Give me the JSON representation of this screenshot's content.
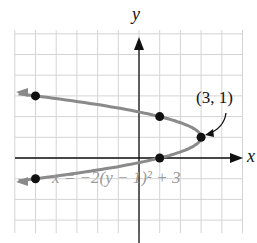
{
  "chart_data": {
    "type": "line",
    "title": "",
    "xlabel": "x",
    "ylabel": "y",
    "xlim": [
      -6,
      5
    ],
    "ylim": [
      -3.6,
      6.2
    ],
    "grid": true,
    "equation": "x = −2(y − 1)² + 3",
    "vertex_label": "(3, 1)",
    "vertex": [
      3,
      1
    ],
    "points": [
      {
        "x": -5,
        "y": 3
      },
      {
        "x": 1,
        "y": 2
      },
      {
        "x": 3,
        "y": 1
      },
      {
        "x": 1,
        "y": 0
      },
      {
        "x": -5,
        "y": -1
      }
    ],
    "curve_color": "#8a8a8a",
    "point_color": "#111111"
  }
}
